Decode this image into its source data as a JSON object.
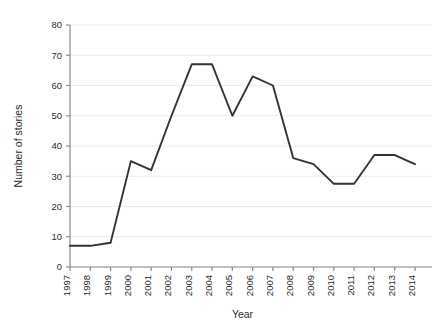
{
  "chart_data": {
    "type": "line",
    "title": "",
    "xlabel": "Year",
    "ylabel": "Number of stories",
    "x": [
      1997,
      1998,
      1999,
      2000,
      2001,
      2002,
      2003,
      2004,
      2005,
      2006,
      2007,
      2008,
      2009,
      2010,
      2011,
      2012,
      2013,
      2014
    ],
    "categories": [
      "1997",
      "1998",
      "1999",
      "2000",
      "2001",
      "2002",
      "2003",
      "2004",
      "2005",
      "2006",
      "2007",
      "2008",
      "2009",
      "2010",
      "2011",
      "2012",
      "2013",
      "2014"
    ],
    "values": [
      7,
      7,
      8,
      35,
      32,
      50,
      67,
      67,
      50,
      63,
      60,
      36,
      34,
      27.5,
      27.5,
      37,
      37,
      34
    ],
    "series": [
      {
        "name": "Number of stories",
        "values": [
          7,
          7,
          8,
          35,
          32,
          50,
          67,
          67,
          50,
          63,
          60,
          36,
          34,
          27.5,
          27.5,
          37,
          37,
          34
        ]
      }
    ],
    "ylim": [
      0,
      80
    ],
    "yticks": [
      0,
      10,
      20,
      30,
      40,
      50,
      60,
      70,
      80
    ],
    "ytick_labels": [
      "0",
      "10",
      "20",
      "30",
      "40",
      "50",
      "60",
      "70",
      "80"
    ],
    "xtick_labels": [
      "1997",
      "1998",
      "1999",
      "2000",
      "2001",
      "2002",
      "2003",
      "2004",
      "2005",
      "2006",
      "2007",
      "2008",
      "2009",
      "2010",
      "2011",
      "2012",
      "2013",
      "2014"
    ],
    "grid": true,
    "grid_axis": "y",
    "legend": false,
    "legend_position": "none",
    "line_color": "#333333",
    "grid_color": "#ececec",
    "axis_color": "#8c8c8c",
    "background_color": "#ffffff"
  }
}
